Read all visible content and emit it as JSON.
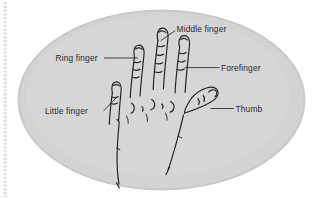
{
  "figure": {
    "name": "hand-anatomy-diagram",
    "background_color": "#ffffff",
    "oval_fill": "#d2d2d2",
    "oval_edge_color": "#bcbcbc",
    "ink_color": "#231f1d",
    "label_color": "#2b2b2b",
    "leader_color": "#3a3a3a",
    "scan_artifact_color": "#c8c8c8"
  },
  "labels": {
    "middle_finger": "Middle finger",
    "ring_finger": "Ring finger",
    "forefinger": "Forefinger",
    "little_finger": "Little finger",
    "thumb": "Thumb"
  }
}
